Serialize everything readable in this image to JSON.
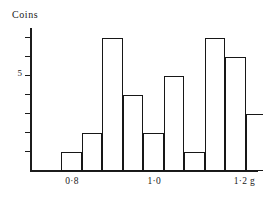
{
  "chart_data": {
    "type": "bar",
    "title": "",
    "ylabel": "Coins",
    "xlabel": "g",
    "grid": false,
    "legend": "none",
    "y_axis": {
      "min": 0,
      "max": 7.5,
      "labeled_ticks": [
        {
          "value": 5,
          "label": "5"
        }
      ],
      "tick_values": [
        1,
        2,
        3,
        4,
        5,
        6,
        7
      ]
    },
    "x_axis": {
      "min": 0.7,
      "max": 1.25,
      "bin_width": 0.05,
      "unit": "g",
      "tick_labels": [
        {
          "value": 0.8,
          "label": "0·8"
        },
        {
          "value": 1.0,
          "label": "1·0"
        },
        {
          "value": 1.2,
          "label": "1·2"
        }
      ],
      "unit_label": "g"
    },
    "bin_starts": [
      0.7,
      0.75,
      0.8,
      0.85,
      0.9,
      0.95,
      1.0,
      1.05,
      1.1,
      1.15,
      1.2
    ],
    "categories": [
      "0·70–0·75",
      "0·75–0·80",
      "0·80–0·85",
      "0·85–0·90",
      "0·90–0·95",
      "0·95–1·00",
      "1·00–1·05",
      "1·05–1·10",
      "1·10–1·15",
      "1·15–1·20",
      "1·20–1·25"
    ],
    "values": [
      1,
      2,
      7,
      4,
      2,
      5,
      1,
      7,
      6,
      3,
      2
    ],
    "colors": {
      "bar_outline": "#171717",
      "bar_fill": "#ffffff",
      "axis": "#1c1c1c",
      "text": "#1a1a1a",
      "background": "#ffffff"
    }
  },
  "labels": {
    "y_axis_title": "Coins",
    "x_unit": "g"
  }
}
